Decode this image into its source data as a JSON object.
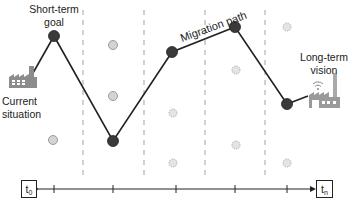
{
  "diagram": {
    "labels": {
      "short_term": [
        "Short-term",
        "goal"
      ],
      "current": [
        "Current",
        "situation"
      ],
      "migration": "Migration path",
      "long_term": [
        "Long-term",
        "vision"
      ]
    },
    "timeline": {
      "start": "t",
      "start_sub": "0",
      "end": "t",
      "end_sub": "n"
    },
    "colors": {
      "node_fill": "#3a3a3a",
      "path": "#222222",
      "gray_node": "#cfcfcf",
      "dotted_node": "#d8d8d8",
      "dashed": "#b5b5b5",
      "factory": "#8c8c8c"
    }
  }
}
